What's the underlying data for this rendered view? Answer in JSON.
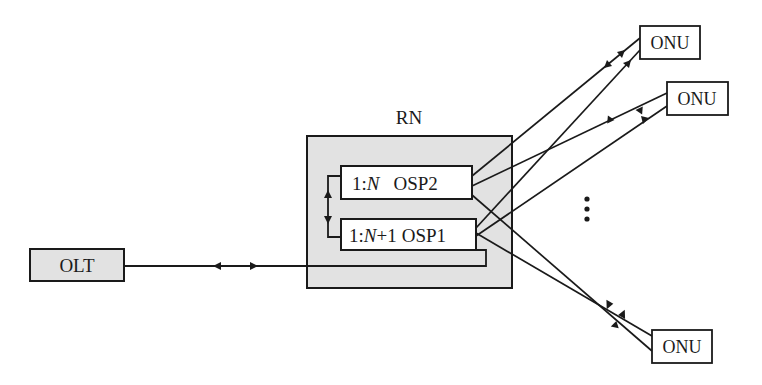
{
  "diagram": {
    "title": "",
    "nodes": {
      "olt": {
        "label": "OLT"
      },
      "rn": {
        "label": "RN"
      },
      "osp2": {
        "ratio_prefix": "1:",
        "ratio_var": "N",
        "ratio_suffix": "",
        "name": "OSP2"
      },
      "osp1": {
        "ratio_prefix": "1:",
        "ratio_var": "N",
        "ratio_suffix": "+1",
        "name": "OSP1"
      },
      "onu_top": {
        "label": "ONU"
      },
      "onu_middle": {
        "label": "ONU"
      },
      "onu_bottom": {
        "label": "ONU"
      }
    },
    "ellipsis": "⋮",
    "colors": {
      "box_fill_gray": "#e2e2e2",
      "box_fill_white": "#ffffff",
      "stroke": "#1a1a1a"
    },
    "edges": [
      {
        "from": "OLT",
        "to": "OSP1",
        "bidirectional": true
      },
      {
        "from": "OSP2",
        "to": "OSP1",
        "bidirectional": true,
        "type": "protection switch"
      },
      {
        "from": "OSP2",
        "to": "ONU top",
        "bidirectional": true
      },
      {
        "from": "OSP1",
        "to": "ONU top",
        "direction": "to ONU"
      },
      {
        "from": "OSP2",
        "to": "ONU middle",
        "bidirectional": true
      },
      {
        "from": "OSP1",
        "to": "ONU middle",
        "direction": "to ONU"
      },
      {
        "from": "OSP1",
        "to": "ONU bottom",
        "bidirectional": true
      },
      {
        "from": "OSP2",
        "to": "ONU bottom",
        "direction": "to ONU"
      }
    ]
  }
}
